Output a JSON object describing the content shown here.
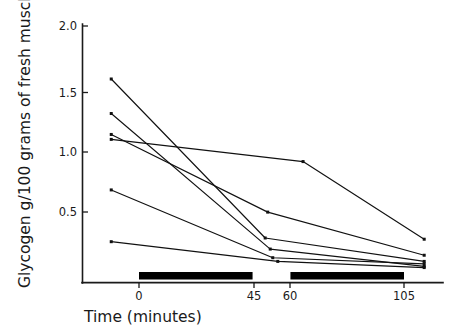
{
  "chart_data": {
    "type": "line",
    "title": "",
    "xlabel": "Time (minutes)",
    "ylabel": "Glycogen g/100 grams of fresh muscle",
    "xlim": [
      -12,
      114
    ],
    "ylim": [
      0.0,
      2.0
    ],
    "grid": false,
    "legend": "none",
    "xticks": [
      0,
      45,
      60,
      105
    ],
    "xtick_labels": [
      "0",
      "45",
      "60",
      "105"
    ],
    "yticks": [
      0.5,
      1.0,
      1.5,
      2.0
    ],
    "ytick_labels": [
      "0.5",
      "1.0",
      "1.5",
      "2.0"
    ],
    "annotations": [
      {
        "name": "exercise-bout-1",
        "type": "bar",
        "x_start": 0,
        "x_end": 45,
        "y": 0.02
      },
      {
        "name": "exercise-bout-2",
        "type": "bar",
        "x_start": 60,
        "x_end": 105,
        "y": 0.02
      }
    ],
    "series": [
      {
        "name": "subject-1",
        "x": [
          -11,
          50,
          113
        ],
        "values": [
          1.57,
          0.28,
          0.09
        ]
      },
      {
        "name": "subject-2",
        "x": [
          -11,
          52,
          113
        ],
        "values": [
          1.29,
          0.19,
          0.05
        ]
      },
      {
        "name": "subject-3",
        "x": [
          -11,
          51,
          113
        ],
        "values": [
          1.12,
          0.49,
          0.14
        ]
      },
      {
        "name": "subject-4",
        "x": [
          -11,
          65,
          113
        ],
        "values": [
          1.08,
          0.9,
          0.27
        ]
      },
      {
        "name": "subject-5",
        "x": [
          -11,
          53,
          113
        ],
        "values": [
          0.67,
          0.12,
          0.07
        ]
      },
      {
        "name": "subject-6",
        "x": [
          -11,
          55,
          113
        ],
        "values": [
          0.25,
          0.09,
          0.04
        ]
      }
    ]
  },
  "axes": {
    "y_axis_title": "Glycogen g/100 grams of fresh muscle",
    "x_axis_title": "Time (minutes)"
  }
}
